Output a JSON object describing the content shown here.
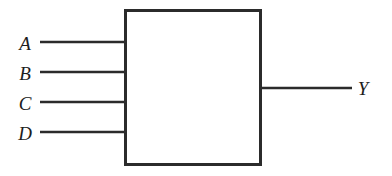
{
  "figure": {
    "canvas": {
      "width": 392,
      "height": 176,
      "background": "#ffffff"
    },
    "colors": {
      "stroke": "#2b2b2b",
      "label": "#1d1d1d",
      "fill": "#ffffff"
    },
    "block": {
      "name": "logic-block",
      "x": 124,
      "y": 9,
      "width": 138,
      "height": 157,
      "stroke_width": 3,
      "interior_text": ""
    },
    "inputs": [
      {
        "label": "A",
        "label_x": 25,
        "label_y": 43,
        "wire_y": 42,
        "wire_x1": 40,
        "wire_x2": 126
      },
      {
        "label": "B",
        "label_x": 25,
        "label_y": 73,
        "wire_y": 72,
        "wire_x1": 40,
        "wire_x2": 126
      },
      {
        "label": "C",
        "label_x": 25,
        "label_y": 103,
        "wire_y": 102,
        "wire_x1": 40,
        "wire_x2": 126
      },
      {
        "label": "D",
        "label_x": 25,
        "label_y": 133,
        "wire_y": 132,
        "wire_x1": 40,
        "wire_x2": 126
      }
    ],
    "outputs": [
      {
        "label": "Y",
        "label_x": 363,
        "label_y": 88,
        "wire_y": 88,
        "wire_x1": 260,
        "wire_x2": 352
      }
    ],
    "wire_stroke_width": 2.6
  }
}
